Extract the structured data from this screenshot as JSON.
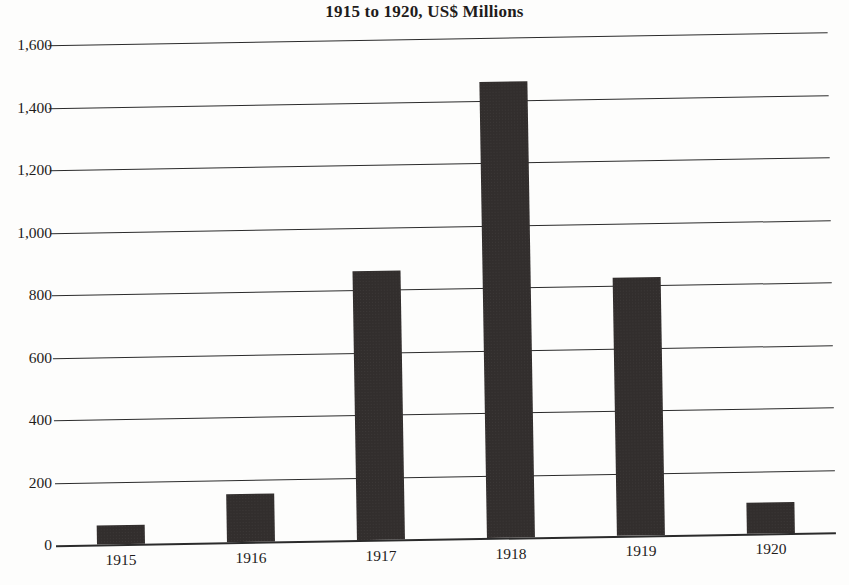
{
  "chart_data": {
    "type": "bar",
    "title": "1915 to 1920, US$ Millions",
    "xlabel": "",
    "ylabel": "",
    "categories": [
      "1915",
      "1916",
      "1917",
      "1918",
      "1919",
      "1920"
    ],
    "values": [
      60,
      155,
      860,
      1460,
      825,
      100
    ],
    "series": [
      {
        "name": "US$ Millions",
        "values": [
          60,
          155,
          860,
          1460,
          825,
          100
        ]
      }
    ],
    "ylim": [
      0,
      1600
    ],
    "ytick_values": [
      0,
      200,
      400,
      600,
      800,
      1000,
      1200,
      1400,
      1600
    ],
    "ytick_labels": [
      "0",
      "200",
      "400",
      "600",
      "800",
      "1,000",
      "1,200",
      "1,400",
      "1,600"
    ],
    "grid": true,
    "grid_axis": "y",
    "legend": false,
    "legend_position": "none",
    "bar_color": "#322e2d",
    "background_color": "#fdfdfc",
    "axis_color": "#2b2b2b"
  }
}
